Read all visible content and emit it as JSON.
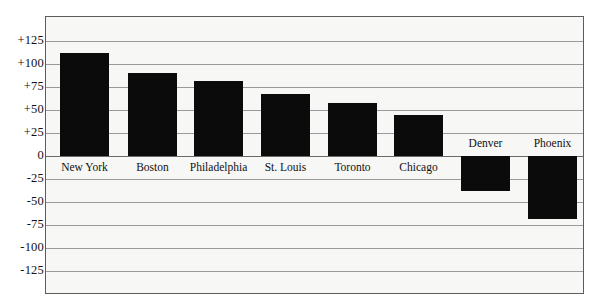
{
  "chart_data": {
    "type": "bar",
    "title": "",
    "subtitle": "",
    "xlabel": "",
    "ylabel": "",
    "categories": [
      "New York",
      "Boston",
      "Philadelphia",
      "St. Louis",
      "Toronto",
      "Chicago",
      "Denver",
      "Phoenix"
    ],
    "values": [
      112,
      90,
      81,
      67,
      58,
      45,
      -38,
      -68
    ],
    "ylim": [
      -125,
      125
    ],
    "yticks": [
      "+125",
      "+100",
      "+75",
      "+50",
      "+25",
      "0",
      "-25",
      "-50",
      "-75",
      "-100",
      "-125"
    ],
    "ytick_values": [
      125,
      100,
      75,
      50,
      25,
      0,
      -25,
      -50,
      -75,
      -100,
      -125
    ],
    "grid": true,
    "legend": "none",
    "bar_color": "#0b0b0b",
    "plot_background": "#f7f7f5",
    "grid_color": "#9a9a9a",
    "frame_color": "#5c5c5c"
  },
  "axis": {
    "ticks": [
      {
        "label": "+125",
        "value": 125
      },
      {
        "label": "+100",
        "value": 100
      },
      {
        "label": "+75",
        "value": 75
      },
      {
        "label": "+50",
        "value": 50
      },
      {
        "label": "+25",
        "value": 25
      },
      {
        "label": "0",
        "value": 0
      },
      {
        "label": "-25",
        "value": -25
      },
      {
        "label": "-50",
        "value": -50
      },
      {
        "label": "-75",
        "value": -75
      },
      {
        "label": "-100",
        "value": -100
      },
      {
        "label": "-125",
        "value": -125
      }
    ]
  },
  "bars": [
    {
      "label": "New York",
      "value": 112
    },
    {
      "label": "Boston",
      "value": 90
    },
    {
      "label": "Philadelphia",
      "value": 81
    },
    {
      "label": "St. Louis",
      "value": 67
    },
    {
      "label": "Toronto",
      "value": 58
    },
    {
      "label": "Chicago",
      "value": 45
    },
    {
      "label": "Denver",
      "value": -38
    },
    {
      "label": "Phoenix",
      "value": -68
    }
  ]
}
